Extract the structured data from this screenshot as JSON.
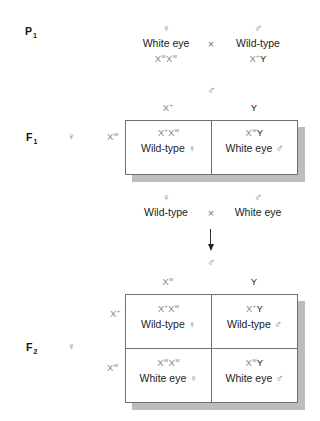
{
  "generations": {
    "p1": {
      "label": "P",
      "sub": "1"
    },
    "f1": {
      "label": "F",
      "sub": "1"
    },
    "f2": {
      "label": "F",
      "sub": "2"
    }
  },
  "symbols": {
    "female": "♀",
    "male": "♂",
    "cross": "×"
  },
  "p1_cross": {
    "female": {
      "phenotype": "White eye",
      "genotype": {
        "a1": "X",
        "a1_sup": "w",
        "a2": "X",
        "a2_sup": "w"
      }
    },
    "male": {
      "phenotype": "Wild-type",
      "genotype": {
        "a1": "X",
        "a1_sup": "+",
        "a2": "Y"
      }
    }
  },
  "f1_square": {
    "col_headers": [
      {
        "base": "X",
        "sup": "+"
      },
      {
        "base": "Y",
        "sup": ""
      }
    ],
    "row_headers": [
      {
        "base": "X",
        "sup": "w"
      }
    ],
    "cells": [
      {
        "g1": "X",
        "g1_sup": "+",
        "g2": "X",
        "g2_sup": "w",
        "phenotype": "Wild-type",
        "sex": "♀"
      },
      {
        "g1": "X",
        "g1_sup": "w",
        "g2": "Y",
        "g2_sup": "",
        "phenotype": "White eye",
        "sex": "♂"
      }
    ]
  },
  "f1_cross": {
    "female": {
      "phenotype": "Wild-type"
    },
    "male": {
      "phenotype": "White eye"
    }
  },
  "f2_square": {
    "col_headers": [
      {
        "base": "X",
        "sup": "w"
      },
      {
        "base": "Y",
        "sup": ""
      }
    ],
    "row_headers": [
      {
        "base": "X",
        "sup": "+"
      },
      {
        "base": "X",
        "sup": "w"
      }
    ],
    "cells": [
      {
        "g1": "X",
        "g1_sup": "+",
        "g2": "X",
        "g2_sup": "w",
        "phenotype": "Wild-type",
        "sex": "♀"
      },
      {
        "g1": "X",
        "g1_sup": "+",
        "g2": "Y",
        "g2_sup": "",
        "phenotype": "Wild-type",
        "sex": "♂"
      },
      {
        "g1": "X",
        "g1_sup": "w",
        "g2": "X",
        "g2_sup": "w",
        "phenotype": "White eye",
        "sex": "♀"
      },
      {
        "g1": "X",
        "g1_sup": "w",
        "g2": "Y",
        "g2_sup": "",
        "phenotype": "White eye",
        "sex": "♂"
      }
    ]
  }
}
